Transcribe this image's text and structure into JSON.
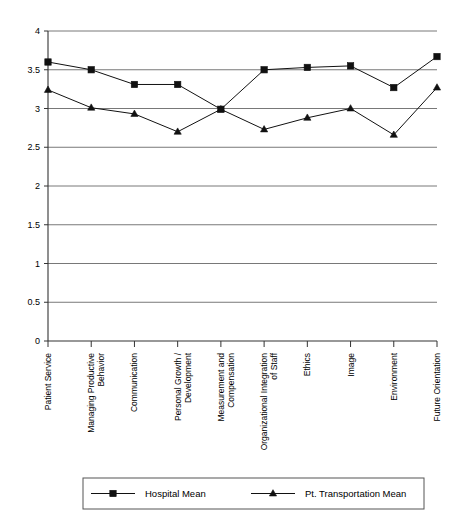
{
  "chart_data": {
    "type": "line",
    "title": "",
    "subtitle": "",
    "xlabel": "",
    "ylabel": "",
    "ylim": [
      0,
      4
    ],
    "ytick_step": 0.5,
    "grid": true,
    "legend_position": "bottom",
    "categories": [
      "Patient Service",
      "Managing Productive Behavior",
      "Communication",
      "Personal Growth / Development",
      "Measurement and Compensation",
      "Organizational Integration of Staff",
      "Ethics",
      "Image",
      "Environment",
      "Future Orientation"
    ],
    "category_lines": [
      [
        "Patient Service"
      ],
      [
        "Managing Productive",
        "Behavior"
      ],
      [
        "Communication"
      ],
      [
        "Personal Growth /",
        "Development"
      ],
      [
        "Measurement and",
        "Compensation"
      ],
      [
        "Organizational Integration",
        "of Staff"
      ],
      [
        "Ethics"
      ],
      [
        "Image"
      ],
      [
        "Environment"
      ],
      [
        "Future Orientation"
      ]
    ],
    "ytick_labels": [
      "0",
      "0.5",
      "1",
      "1.5",
      "2",
      "2.5",
      "3",
      "3.5",
      "4"
    ],
    "ytick_values": [
      0,
      0.5,
      1,
      1.5,
      2,
      2.5,
      3,
      3.5,
      4
    ],
    "series": [
      {
        "name": "Hospital Mean",
        "marker": "square",
        "color": "#111111",
        "values": [
          3.6,
          3.5,
          3.31,
          3.31,
          2.99,
          3.5,
          3.53,
          3.55,
          3.27,
          3.67
        ]
      },
      {
        "name": "Pt. Transportation Mean",
        "marker": "triangle",
        "color": "#111111",
        "values": [
          3.24,
          3.01,
          2.93,
          2.7,
          2.99,
          2.73,
          2.88,
          3.0,
          2.66,
          3.27
        ]
      }
    ]
  },
  "legend": {
    "entries": [
      {
        "label": "Hospital Mean",
        "marker": "square"
      },
      {
        "label": "Pt. Transportation Mean",
        "marker": "triangle"
      }
    ]
  }
}
